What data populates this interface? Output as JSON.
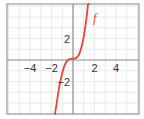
{
  "chart_data": {
    "type": "line",
    "title": "",
    "xlabel": "",
    "ylabel": "",
    "xlim": [
      -6.1,
      6.1
    ],
    "ylim": [
      -5.0,
      5.2
    ],
    "grid": true,
    "grid_step": 1,
    "x_ticks": [
      -4,
      -2,
      2,
      4
    ],
    "y_ticks": [
      2,
      -2
    ],
    "x_tick_labels": [
      "−4",
      "−2",
      "2",
      "4"
    ],
    "y_tick_labels": [
      "2",
      "−2"
    ],
    "series": [
      {
        "name": "f",
        "label": "f",
        "color": "#e8443a",
        "x": [
          -1.67,
          -1.5,
          -1.4,
          -1.3,
          -1.2,
          -1.1,
          -1.0,
          -0.9,
          -0.8,
          -0.7,
          -0.6,
          -0.5,
          -0.4,
          -0.3,
          -0.2,
          -0.1,
          0.0,
          0.1,
          0.2,
          0.3,
          0.4,
          0.5,
          0.6,
          0.7,
          0.8,
          0.9,
          1.0,
          1.1,
          1.2,
          1.3,
          1.4,
          1.5
        ],
        "y": [
          -5.0,
          -3.9,
          -3.2,
          -2.6,
          -2.1,
          -1.6,
          -1.2,
          -0.85,
          -0.55,
          -0.32,
          -0.15,
          -0.03,
          0.04,
          0.08,
          0.1,
          0.11,
          0.12,
          0.13,
          0.15,
          0.2,
          0.28,
          0.42,
          0.62,
          0.9,
          1.25,
          1.68,
          2.2,
          2.8,
          3.5,
          4.3,
          5.2,
          5.2
        ]
      }
    ]
  },
  "colors": {
    "curve": "#e8443a",
    "grid": "#e4e4e4",
    "axis": "#8a8a8a",
    "frame": "#9a9a9a"
  }
}
